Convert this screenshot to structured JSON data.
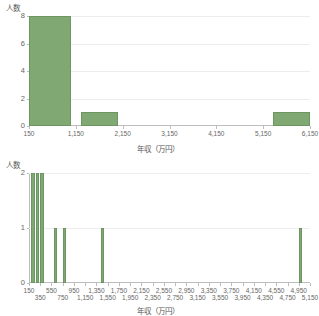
{
  "figure": {
    "background_color": "#ffffff",
    "bar_color": "#7fa873",
    "bar_edge_color": "#6d9762",
    "grid_color": "#ededed",
    "axis_color": "#bdbdbd",
    "text_color": "#555555"
  },
  "chart_data": [
    {
      "type": "bar",
      "name": "income-histogram-wide-bins",
      "title": "",
      "xlabel": "年収（万円）",
      "ylabel": "人数",
      "grid": true,
      "legend": "none",
      "xlim": [
        150,
        6150
      ],
      "ylim": [
        0,
        8
      ],
      "yticks": [
        "0",
        "2",
        "4",
        "6",
        "8"
      ],
      "ytick_values": [
        0,
        2,
        4,
        6,
        8
      ],
      "xticks": [
        "150",
        "1,150",
        "2,150",
        "3,150",
        "4,150",
        "5,150",
        "6,150"
      ],
      "xtick_values": [
        150,
        1150,
        2150,
        3150,
        4150,
        5150,
        6150
      ],
      "bin_width": 200,
      "bins": [
        {
          "start": 150,
          "end": 1050,
          "value": 8
        },
        {
          "start": 1250,
          "end": 2050,
          "value": 1
        },
        {
          "start": 5350,
          "end": 6150,
          "value": 1
        }
      ]
    },
    {
      "type": "bar",
      "name": "income-histogram-narrow-bins",
      "title": "",
      "xlabel": "年収（万円）",
      "ylabel": "人数",
      "grid": true,
      "legend": "none",
      "xlim": [
        150,
        5150
      ],
      "ylim": [
        0,
        2
      ],
      "yticks": [
        "0",
        "1",
        "2"
      ],
      "ytick_values": [
        0,
        1,
        2
      ],
      "xticks": [
        "150",
        "350",
        "550",
        "750",
        "950",
        "1,150",
        "1,350",
        "1,550",
        "1,750",
        "1,950",
        "2,150",
        "2,350",
        "2,550",
        "2,750",
        "2,950",
        "3,150",
        "3,350",
        "3,550",
        "3,750",
        "3,950",
        "4,150",
        "4,350",
        "4,550",
        "4,750",
        "4,950",
        "5,150"
      ],
      "xtick_values": [
        150,
        350,
        550,
        750,
        950,
        1150,
        1350,
        1550,
        1750,
        1950,
        2150,
        2350,
        2550,
        2750,
        2950,
        3150,
        3350,
        3550,
        3750,
        3950,
        4150,
        4350,
        4550,
        4750,
        4950,
        5150
      ],
      "bin_width": 60,
      "bins": [
        {
          "start": 190,
          "end": 250,
          "value": 2
        },
        {
          "start": 270,
          "end": 330,
          "value": 2
        },
        {
          "start": 350,
          "end": 410,
          "value": 2
        },
        {
          "start": 590,
          "end": 650,
          "value": 1
        },
        {
          "start": 750,
          "end": 810,
          "value": 1
        },
        {
          "start": 1430,
          "end": 1490,
          "value": 1
        },
        {
          "start": 4950,
          "end": 5010,
          "value": 1
        }
      ]
    }
  ]
}
